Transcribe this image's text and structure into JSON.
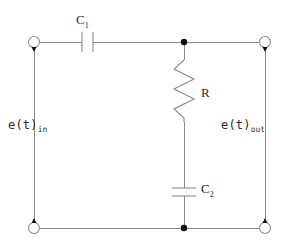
{
  "diagram": {
    "type": "electrical-circuit-schematic",
    "background_color": "#ffffff",
    "wire_color": "#8a8a8a",
    "label_color": "#2b2b2b",
    "junction_color": "#111111"
  },
  "labels": {
    "c1": {
      "symbol": "C",
      "subscript": "1"
    },
    "c2": {
      "symbol": "C",
      "subscript": "2"
    },
    "r": {
      "symbol": "R"
    },
    "e_in": {
      "symbol": "e(t)",
      "subscript": "in"
    },
    "e_out": {
      "symbol": "e(t)",
      "subscript": "out"
    }
  },
  "components": [
    {
      "id": "C1",
      "kind": "capacitor",
      "orientation": "vertical-plates",
      "label": "C1",
      "branch": "series-top"
    },
    {
      "id": "R",
      "kind": "resistor",
      "orientation": "vertical-zigzag",
      "label": "R",
      "branch": "shunt-middle"
    },
    {
      "id": "C2",
      "kind": "capacitor",
      "orientation": "horizontal-plates",
      "label": "C2",
      "branch": "shunt-middle"
    }
  ],
  "terminals": [
    {
      "id": "in-top",
      "kind": "open-circle",
      "label": "e(t)in",
      "position": "top-left"
    },
    {
      "id": "in-bottom",
      "kind": "open-circle",
      "label": "e(t)in",
      "position": "bottom-left"
    },
    {
      "id": "out-top",
      "kind": "open-circle",
      "label": "e(t)out",
      "position": "top-right"
    },
    {
      "id": "out-bottom",
      "kind": "open-circle",
      "label": "e(t)out",
      "position": "bottom-right"
    }
  ],
  "junctions": [
    {
      "id": "node-top-mid",
      "kind": "filled-dot",
      "position": "top-rail-center"
    },
    {
      "id": "node-bottom-mid",
      "kind": "filled-dot",
      "position": "bottom-rail-center"
    }
  ]
}
